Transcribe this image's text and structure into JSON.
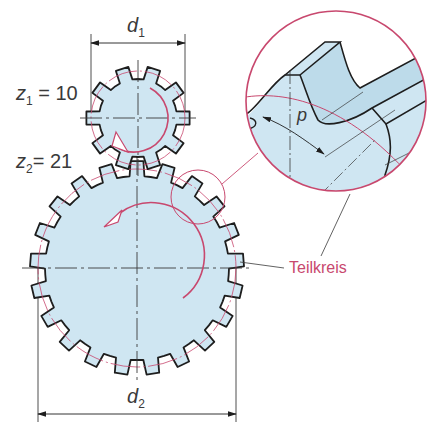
{
  "diagram": {
    "colors": {
      "gear_fill": "#cfe6f2",
      "outline": "#1e1e1e",
      "accent": "#c8486e",
      "thin_line": "#3a3a3a"
    },
    "gear1": {
      "label_var": "z",
      "label_sub": "1",
      "label_eq": " = 10",
      "teeth": 10,
      "cx": 138,
      "cy": 118,
      "r_tip": 52,
      "r_root": 39,
      "r_pitch": 47
    },
    "gear2": {
      "label_var": "z",
      "label_sub": "2",
      "label_eq": "= 21",
      "teeth": 21,
      "cx": 137,
      "cy": 268,
      "r_tip": 107,
      "r_root": 92,
      "r_pitch": 99
    },
    "dimensions": {
      "d1": {
        "var": "d",
        "sub": "1"
      },
      "d2": {
        "var": "d",
        "sub": "2"
      }
    },
    "detail": {
      "pitch_symbol": "p",
      "callout": "Teilkreis"
    }
  }
}
